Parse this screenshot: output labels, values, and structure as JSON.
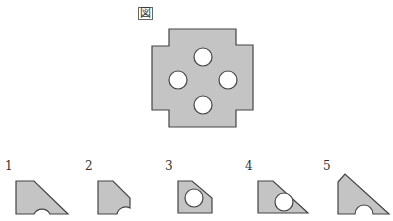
{
  "figure": {
    "label": "図",
    "colors": {
      "fill": "#c4c4c4",
      "stroke": "#444444",
      "hole": "#ffffff"
    }
  },
  "options": [
    {
      "number": "1",
      "description": "Trapezoid with diagonal right edge and semicircular notch on bottom edge"
    },
    {
      "number": "2",
      "description": "Pentagon with clipped top-right corner and semicircular notch at bottom-right"
    },
    {
      "number": "3",
      "description": "Pentagon with clipped top-right corner and a full circular hole inside"
    },
    {
      "number": "4",
      "description": "Trapezoid with diagonal right edge and a full circular hole near bottom"
    },
    {
      "number": "5",
      "description": "Triangle-like shape with clipped top and semicircular notch on bottom edge"
    }
  ]
}
